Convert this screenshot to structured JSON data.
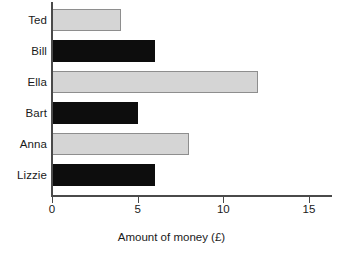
{
  "chart_data": {
    "type": "bar",
    "orientation": "horizontal",
    "title": "",
    "xlabel": "Amount of money (£)",
    "ylabel": "",
    "categories": [
      "Ted",
      "Bill",
      "Ella",
      "Bart",
      "Anna",
      "Lizzie"
    ],
    "values": [
      4,
      6,
      12,
      5,
      8,
      6
    ],
    "bar_colors": [
      "#d5d5d5",
      "#0d0d0d",
      "#d5d5d5",
      "#0d0d0d",
      "#d5d5d5",
      "#0d0d0d"
    ],
    "xlim": [
      0,
      16.4
    ],
    "xticks": [
      0,
      5,
      10,
      15
    ],
    "xtick_labels": [
      "0",
      "5",
      "10",
      "15"
    ],
    "grid": false,
    "legend": null,
    "bars": [
      {
        "label": "Ted",
        "value": 4,
        "color": "#d5d5d5",
        "style": "light"
      },
      {
        "label": "Bill",
        "value": 6,
        "color": "#0d0d0d",
        "style": "dark"
      },
      {
        "label": "Ella",
        "value": 12,
        "color": "#d5d5d5",
        "style": "light"
      },
      {
        "label": "Bart",
        "value": 5,
        "color": "#0d0d0d",
        "style": "dark"
      },
      {
        "label": "Anna",
        "value": 8,
        "color": "#d5d5d5",
        "style": "light"
      },
      {
        "label": "Lizzie",
        "value": 6,
        "color": "#0d0d0d",
        "style": "dark"
      }
    ]
  },
  "axis": {
    "x_title": "Amount of money (£)",
    "tick_0": "0",
    "tick_5": "5",
    "tick_10": "10",
    "tick_15": "15"
  }
}
